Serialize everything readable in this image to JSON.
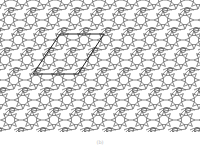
{
  "figure": {
    "pattern": {
      "area": {
        "x": 0,
        "y": 0,
        "width": 200,
        "height": 132
      },
      "cell_a": [
        22,
        0
      ],
      "cell_b": [
        -13,
        20
      ],
      "line_color": "#555555",
      "background": "#ffffff"
    },
    "unit_cell": {
      "label": "unit cell parallelogram",
      "points": [
        [
          60,
          34
        ],
        [
          104,
          34
        ],
        [
          78,
          74
        ],
        [
          33,
          74
        ]
      ],
      "stroke": "#222222"
    }
  },
  "caption": {
    "text": "(b)"
  }
}
